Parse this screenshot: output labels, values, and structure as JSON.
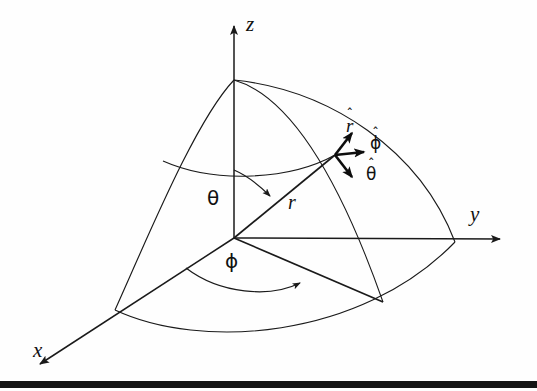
{
  "figure": {
    "background_color": "#fefefe",
    "line_color": "#1a1a1a",
    "bar_color": "#141414"
  },
  "axes": [
    {
      "name": "z-axis",
      "label": "z",
      "direction": "up",
      "arrow": true
    },
    {
      "name": "y-axis",
      "label": "y",
      "direction": "right",
      "arrow": true
    },
    {
      "name": "x-axis",
      "label": "x",
      "direction": "down-left",
      "arrow": true
    }
  ],
  "coordinates": [
    {
      "name": "radius",
      "label": "r",
      "kind": "italic-latin"
    },
    {
      "name": "polar-angle",
      "label": "θ",
      "kind": "greek"
    },
    {
      "name": "azimuthal-angle",
      "label": "ϕ",
      "kind": "greek"
    }
  ],
  "unit_vectors": [
    {
      "name": "r-hat",
      "base": "r",
      "hat": "ˆ",
      "italic": true,
      "direction": "up-right"
    },
    {
      "name": "phi-hat",
      "base": "ϕ",
      "hat": "ˆ",
      "italic": false,
      "direction": "right"
    },
    {
      "name": "theta-hat",
      "base": "θ",
      "hat": "ˆ",
      "italic": false,
      "direction": "down-right"
    }
  ],
  "geometry": {
    "origin": {
      "x": 234,
      "y": 238
    },
    "pole": {
      "x": 234,
      "y": 80
    },
    "point_on_sphere": {
      "x": 335,
      "y": 155
    },
    "projection_point": {
      "x": 383,
      "y": 302
    },
    "x_axis_sphere_point": {
      "x": 115,
      "y": 310
    },
    "y_axis_sphere_point": {
      "x": 455,
      "y": 242
    }
  }
}
